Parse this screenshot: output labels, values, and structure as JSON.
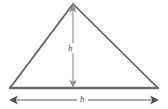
{
  "figure": {
    "name": "triangle-area-diagram",
    "background_color": "#ffffff",
    "width": 168,
    "height": 109
  },
  "triangle": {
    "name": "triangle-outline",
    "stroke_color": "#5a5a5a",
    "base_stroke_color": "#6b6b6b",
    "apex": {
      "x": 73,
      "y": 4
    },
    "left_vertex": {
      "x": 10,
      "y": 88
    },
    "right_vertex": {
      "x": 158,
      "y": 88
    }
  },
  "height_dimension": {
    "name": "height-dimension",
    "label": "h",
    "stroke_color": "#b0b0b0",
    "arrow_color": "#8a8a8a",
    "top": {
      "x": 73,
      "y": 6
    },
    "bottom": {
      "x": 73,
      "y": 87
    },
    "arrow_top": "up",
    "arrow_bottom": "down"
  },
  "base_dimension": {
    "name": "base-dimension",
    "label": "b",
    "stroke_color": "#8a8a8a",
    "arrow_color": "#4a4a4a",
    "left": {
      "x": 11,
      "y": 100
    },
    "right": {
      "x": 157,
      "y": 100
    },
    "arrow_left": "left",
    "arrow_right": "right"
  },
  "labels": {
    "height": "h",
    "base": "b"
  }
}
